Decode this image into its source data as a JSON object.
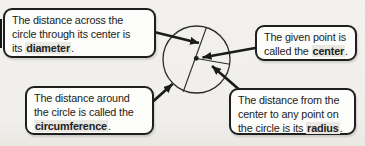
{
  "page": {
    "background_color": "#f0efec",
    "ink_color": "#1b1b1b",
    "box_fill_color": "#fdfdfb",
    "term_highlight_color": "#e9e8e3"
  },
  "callouts": {
    "diameter": {
      "line1": "The distance across the",
      "line2": "circle through its center is",
      "last_pre": "its ",
      "term": "diameter",
      "term_post": "."
    },
    "center": {
      "line1": "The given point is",
      "last_pre": "called the ",
      "term": "center",
      "term_post": "."
    },
    "circumference": {
      "line1": "The distance around",
      "line2": "the circle is called the",
      "last_pre": "",
      "term": "circumference",
      "term_post": "."
    },
    "radius": {
      "line1": "The distance from the",
      "line2": "center to any point on",
      "last_pre": "the circle is its ",
      "term": "radius",
      "term_post": "."
    }
  },
  "diagram": {
    "parts": "circle, diameter-line, radius-line, center-dot, arrows"
  }
}
